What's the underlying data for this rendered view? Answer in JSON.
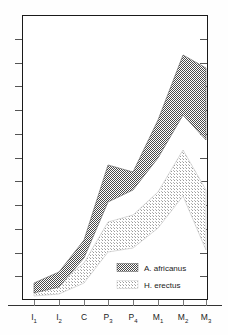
{
  "figure": {
    "title": "",
    "background": "#ffffff",
    "frame_color": "#1a1a1a"
  },
  "legend": {
    "position": "inside-lower-right",
    "entries": [
      {
        "label": "A. africanus",
        "swatch": "dark-dither",
        "color": "#6e6e6e"
      },
      {
        "label": "H. erectus",
        "swatch": "light-dither",
        "color": "#d2d2d2"
      }
    ]
  },
  "axes": {
    "x_tick_labels": [
      {
        "base": "I",
        "sub": "1"
      },
      {
        "base": "I",
        "sub": "2"
      },
      {
        "base": "C",
        "sub": ""
      },
      {
        "base": "P",
        "sub": "3"
      },
      {
        "base": "P",
        "sub": "4"
      },
      {
        "base": "M",
        "sub": "1"
      },
      {
        "base": "M",
        "sub": "2"
      },
      {
        "base": "M",
        "sub": "3"
      }
    ],
    "y_tick_count": 12,
    "y_tick_labels": [],
    "x_axis_label": "",
    "y_axis_label": ""
  },
  "chart_data": {
    "type": "area",
    "title": "",
    "subtitle": "",
    "xlabel": "",
    "ylabel": "",
    "grid": false,
    "legend_position": "inside-lower-right",
    "categories": [
      "I1",
      "I2",
      "C",
      "P3",
      "P4",
      "M1",
      "M2",
      "M3"
    ],
    "category_labels": [
      "I₁",
      "I₂",
      "C",
      "P₃",
      "P₄",
      "M₁",
      "M₂",
      "M₃"
    ],
    "x_positions_px": [
      34,
      59,
      84,
      108,
      133,
      158,
      183,
      206
    ],
    "ylim_px": [
      300,
      15
    ],
    "series": [
      {
        "name": "A. africanus",
        "color": "#6e6e6e",
        "pattern": "50-percent-checkerboard",
        "upper_px": [
          283,
          272,
          240,
          165,
          172,
          120,
          55,
          68
        ],
        "lower_px": [
          293,
          287,
          258,
          202,
          190,
          158,
          115,
          140
        ]
      },
      {
        "name": "H. erectus",
        "color": "#d2d2d2",
        "pattern": "light-dither",
        "upper_px": [
          291,
          283,
          263,
          222,
          215,
          192,
          150,
          190
        ],
        "lower_px": [
          296,
          294,
          283,
          252,
          248,
          228,
          196,
          250
        ]
      }
    ]
  }
}
